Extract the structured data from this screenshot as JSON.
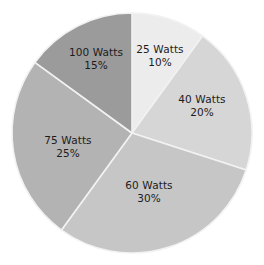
{
  "chart_data": {
    "type": "pie",
    "title": "",
    "subtitle": "",
    "xlabel": "",
    "ylabel": "",
    "legend": "none",
    "grid": false,
    "start_angle_deg": 0,
    "direction": "clockwise",
    "categories": [
      "25 Watts",
      "40 Watts",
      "60 Watts",
      "75 Watts",
      "100 Watts"
    ],
    "values": [
      10,
      20,
      30,
      25,
      15
    ],
    "value_unit": "%",
    "slices": [
      {
        "label": "25 Watts",
        "percent_text": "10%",
        "value": 10,
        "color": "#ececec",
        "label_x": 160,
        "label_y": 55
      },
      {
        "label": "40 Watts",
        "percent_text": "20%",
        "value": 20,
        "color": "#d6d6d6",
        "label_x": 202,
        "label_y": 105
      },
      {
        "label": "60 Watts",
        "percent_text": "30%",
        "value": 30,
        "color": "#c6c6c6",
        "label_x": 149,
        "label_y": 191
      },
      {
        "label": "75 Watts",
        "percent_text": "25%",
        "value": 25,
        "color": "#b3b3b3",
        "label_x": 68,
        "label_y": 146
      },
      {
        "label": "100 Watts",
        "percent_text": "15%",
        "value": 15,
        "color": "#9b9b9b",
        "label_x": 96,
        "label_y": 58
      }
    ],
    "geometry": {
      "center_x": 132,
      "center_y": 133,
      "radius": 120
    },
    "background_color": "#ffffff",
    "separator_color": "#f2f2f2",
    "label_text_color": "#1c1c1c"
  }
}
